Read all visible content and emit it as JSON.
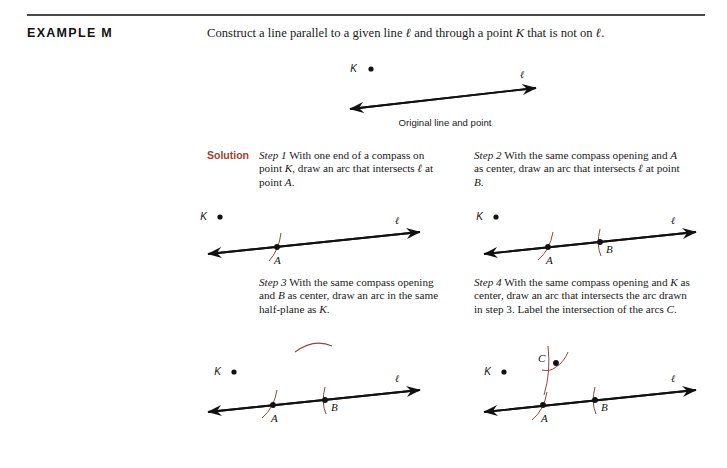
{
  "heading": {
    "example_label": "EXAMPLE M"
  },
  "problem": {
    "text_part1": "Construct a line parallel to a given line ",
    "ell_1": "ℓ",
    "text_part2": " and through a point ",
    "point_k": "K",
    "text_part3": " that is not on ",
    "ell_2": "ℓ",
    "text_part4": "."
  },
  "solution": {
    "label": "Solution"
  },
  "figures": {
    "original": {
      "caption": "Original line and point",
      "point_label": "K",
      "line_label": "ℓ"
    },
    "step1_fig": {
      "point_label": "K",
      "line_label": "ℓ",
      "intersection_a": "A"
    },
    "step2_fig": {
      "point_label": "K",
      "line_label": "ℓ",
      "intersection_a": "A",
      "intersection_b": "B"
    },
    "step3_fig": {
      "point_label": "K",
      "line_label": "ℓ",
      "intersection_a": "A",
      "intersection_b": "B"
    },
    "step4_fig": {
      "point_label": "K",
      "line_label": "ℓ",
      "intersection_a": "A",
      "intersection_b": "B",
      "intersection_c": "C"
    }
  },
  "steps": [
    {
      "lead": "Step 1",
      "body_1": " With one end of a compass on point ",
      "var_1": "K",
      "body_2": ", draw an arc that intersects ",
      "ell": "ℓ",
      "body_3": " at point ",
      "var_2": "A",
      "body_4": "."
    },
    {
      "lead": "Step 2",
      "body_1": " With the same compass opening and ",
      "var_1": "A",
      "body_2": " as center, draw an arc that intersects ",
      "ell": "ℓ",
      "body_3": " at point ",
      "var_2": "B",
      "body_4": "."
    },
    {
      "lead": "Step 3",
      "body_1": " With the same compass opening and ",
      "var_1": "B",
      "body_2": " as center, draw an arc in the same half-plane as ",
      "var_2": "K",
      "body_3": "."
    },
    {
      "lead": "Step 4",
      "body_1": " With the same compass opening and ",
      "var_1": "K",
      "body_2": " as center, draw an arc that intersects the arc drawn in step 3. Label the intersection of the arcs ",
      "var_2": "C",
      "body_3": "."
    }
  ],
  "colors": {
    "rule": "#4a4a4a",
    "solution_accent": "#9c4431",
    "arc": "#8c4a44",
    "line": "#111111",
    "text": "#1a1a1a",
    "background": "#ffffff"
  }
}
